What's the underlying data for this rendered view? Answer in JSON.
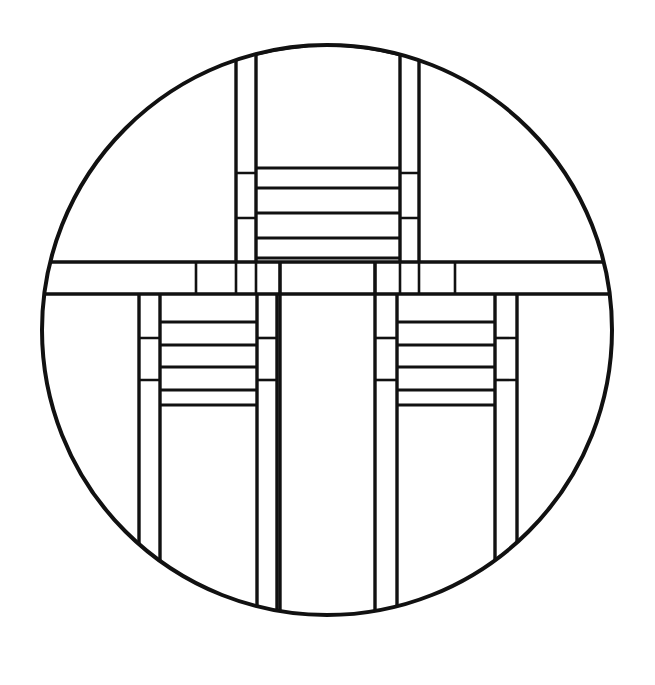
{
  "document": {
    "kind": "line-art-illustration",
    "title": "Prairie School stained glass circular panel",
    "style": "geometric black line drawing on white",
    "canvas": {
      "width": 655,
      "height": 685,
      "background": "#ffffff"
    }
  },
  "palette": {
    "stroke": "#111111",
    "fill": "#ffffff",
    "background": "#ffffff"
  },
  "geometry": {
    "circle": {
      "cx": 327,
      "cy": 330,
      "r": 287,
      "stroke_width": 4
    },
    "stroke_widths": {
      "outline": 4,
      "major": 3.4,
      "minor": 2.6
    },
    "band": {
      "top": 262,
      "bottom": 294
    },
    "top_group": {
      "left_rail_outer_x": 236,
      "left_rail_inner_x": 256,
      "right_rail_inner_x": 400,
      "right_rail_outer_x": 419,
      "rail_top_y": 58,
      "rung_xs": [
        256,
        400
      ],
      "rung_ys": [
        168,
        188,
        213,
        238,
        258
      ],
      "side_splits_left_y": [
        173,
        218
      ],
      "side_splits_right_y": [
        173,
        218
      ]
    },
    "center_column": {
      "left_x": 280,
      "right_x": 375,
      "top_y": 294,
      "bottom_y": 632
    },
    "lower_left_group": {
      "outer_x": 139,
      "inner_x": 160,
      "rung_right_inner_x": 257,
      "rung_right_outer_x": 277,
      "top_y": 294,
      "bottom_y": 578,
      "rung_ys": [
        322,
        345,
        367,
        390,
        405
      ],
      "side_splits_y": [
        338,
        380
      ]
    },
    "lower_right_group": {
      "inner_x": 375,
      "mid_x": 397,
      "rung_right_inner_x": 495,
      "rung_right_outer_x": 517,
      "top_y": 294,
      "bottom_y": 578,
      "rung_ys": [
        322,
        345,
        367,
        390,
        405
      ],
      "side_splits_y": [
        338,
        380
      ]
    },
    "band_divider_xs": [
      196,
      236,
      256,
      280,
      375,
      400,
      419,
      455
    ],
    "band_left_x": 46,
    "band_right_x": 611
  },
  "labels": {
    "figure_caption": ""
  }
}
